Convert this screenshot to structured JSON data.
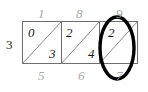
{
  "diagram": {
    "type": "lattice-multiplication-grid",
    "rows": 1,
    "columns": 3,
    "colors": {
      "grid_line": "#6e6e6e",
      "diagonal_line": "#8a8a8a",
      "edge_label": "#a8a8a8",
      "cell_digit": "#1a1a1a",
      "highlight": "#000000",
      "background": "#ffffff"
    },
    "geometry": {
      "grid_left": 22,
      "grid_top": 21,
      "grid_right": 138,
      "grid_bottom": 64,
      "divider_x": [
        61,
        100
      ]
    }
  },
  "labels": {
    "top": [
      {
        "value": "1",
        "column": 1
      },
      {
        "value": "8",
        "column": 2
      },
      {
        "value": "9",
        "column": 3
      }
    ],
    "bottom": [
      {
        "value": "5",
        "column": 1
      },
      {
        "value": "6",
        "column": 2
      },
      {
        "value": "7",
        "column": 3
      }
    ],
    "left": [
      {
        "value": "3",
        "row": 1
      }
    ]
  },
  "cells": [
    {
      "column": 1,
      "upper_left": "0",
      "lower_right": "3"
    },
    {
      "column": 2,
      "upper_left": "2",
      "lower_right": "4"
    },
    {
      "column": 3,
      "upper_left": "2",
      "lower_right": ""
    }
  ],
  "highlight": {
    "shape": "ellipse",
    "target_column": 3,
    "encircles": [
      "9",
      "2",
      "7"
    ],
    "center_x": 117,
    "center_y": 48,
    "radius_x": 17,
    "radius_y": 31
  }
}
